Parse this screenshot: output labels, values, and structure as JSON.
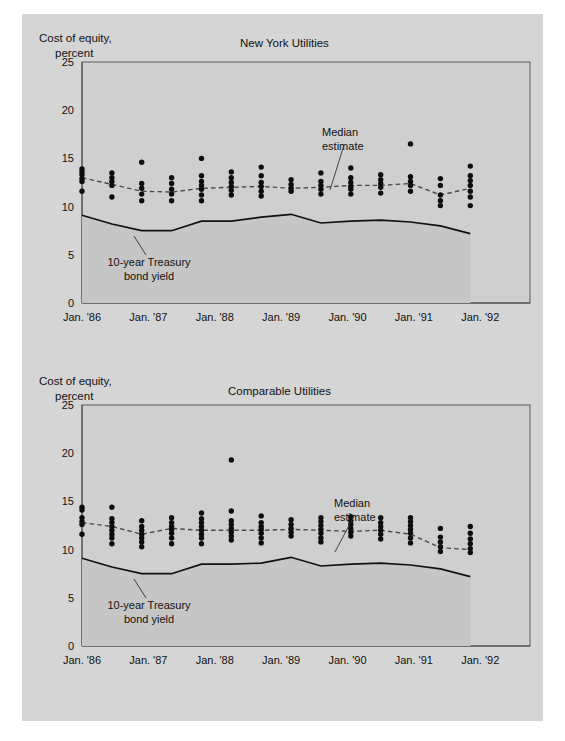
{
  "figure": {
    "background_color": "#d5d5d5",
    "plot_background_color": "#cfcfcf",
    "dot_color": "#0d0d0d"
  },
  "charts": [
    {
      "id": "new-york-utilities",
      "title": "New York Utilities",
      "y_axis_title_line1": "Cost of equity,",
      "y_axis_title_line2": "percent",
      "annotation_median": "Median\nestimate",
      "annotation_median_line1": "Median",
      "annotation_median_line2": "estimate",
      "annotation_treasury_line1": "10-year Treasury",
      "annotation_treasury_line2": "bond yield",
      "y_ticks": [
        "0",
        "5",
        "10",
        "15",
        "20",
        "25"
      ],
      "x_ticks": [
        "Jan. '86",
        "Jan. '87",
        "Jan. '88",
        "Jan. '89",
        "Jan. '90",
        "Jan. '91",
        "Jan. '92"
      ]
    },
    {
      "id": "comparable-utilities",
      "title": "Comparable Utilities",
      "y_axis_title_line1": "Cost of equity,",
      "y_axis_title_line2": "percent",
      "annotation_median_line1": "Median",
      "annotation_median_line2": "estimate",
      "annotation_treasury_line1": "10-year Treasury",
      "annotation_treasury_line2": "bond yield",
      "y_ticks": [
        "0",
        "5",
        "10",
        "15",
        "20",
        "25"
      ],
      "x_ticks": [
        "Jan. '86",
        "Jan. '87",
        "Jan. '88",
        "Jan. '89",
        "Jan. '90",
        "Jan. '91",
        "Jan. '92"
      ]
    }
  ],
  "chart_data": [
    {
      "type": "scatter",
      "id": "new-york-utilities",
      "title": "New York Utilities",
      "xlabel": "",
      "ylabel": "Cost of equity, percent",
      "ylim": [
        0,
        25
      ],
      "yticks": [
        0,
        5,
        10,
        15,
        20,
        25
      ],
      "xlim": [
        1986.0,
        1992.75
      ],
      "xticks": [
        1986,
        1987,
        1988,
        1989,
        1990,
        1991,
        1992
      ],
      "xticklabels": [
        "Jan. '86",
        "Jan. '87",
        "Jan. '88",
        "Jan. '89",
        "Jan. '90",
        "Jan. '91",
        "Jan. '92"
      ],
      "grid": false,
      "legend": "none",
      "annotations": [
        {
          "text": "Median estimate",
          "x": 1989.9,
          "y": 18.0
        },
        {
          "text": "10-year Treasury bond yield",
          "x": 1986.6,
          "y": 5.6
        }
      ],
      "scatter_columns": [
        {
          "x": 1986.0,
          "values": [
            13.9,
            13.6,
            13.3,
            12.9,
            12.6,
            11.6
          ]
        },
        {
          "x": 1986.45,
          "values": [
            13.5,
            13.0,
            12.6,
            12.2,
            11.0
          ]
        },
        {
          "x": 1986.9,
          "values": [
            14.6,
            12.4,
            11.9,
            11.3,
            10.6
          ]
        },
        {
          "x": 1987.35,
          "values": [
            13.0,
            12.4,
            11.8,
            11.3,
            10.6
          ]
        },
        {
          "x": 1987.8,
          "values": [
            15.0,
            13.2,
            12.6,
            12.2,
            11.8,
            11.2,
            10.6
          ]
        },
        {
          "x": 1988.25,
          "values": [
            13.6,
            13.0,
            12.5,
            12.1,
            11.7,
            11.2
          ]
        },
        {
          "x": 1988.7,
          "values": [
            14.1,
            13.2,
            12.5,
            12.1,
            11.6,
            11.1
          ]
        },
        {
          "x": 1989.15,
          "values": [
            12.8,
            12.3,
            11.9,
            11.6
          ]
        },
        {
          "x": 1989.6,
          "values": [
            13.5,
            12.6,
            12.2,
            11.8,
            11.3
          ]
        },
        {
          "x": 1990.05,
          "values": [
            14.0,
            13.0,
            12.5,
            12.1,
            11.8,
            11.3
          ]
        },
        {
          "x": 1990.5,
          "values": [
            13.3,
            12.8,
            12.4,
            12.0,
            11.4
          ]
        },
        {
          "x": 1990.95,
          "values": [
            16.5,
            13.1,
            12.6,
            12.2,
            11.6
          ]
        },
        {
          "x": 1991.4,
          "values": [
            12.9,
            12.2,
            11.2,
            10.6,
            10.1
          ]
        },
        {
          "x": 1991.85,
          "values": [
            14.2,
            13.2,
            12.7,
            12.2,
            11.6,
            11.0,
            10.1
          ]
        }
      ],
      "median_series": {
        "name": "Median estimate",
        "style": "dashed",
        "x": [
          1986.0,
          1986.45,
          1986.9,
          1987.35,
          1987.8,
          1988.25,
          1988.7,
          1989.15,
          1989.6,
          1990.05,
          1990.5,
          1990.95,
          1991.4,
          1991.85
        ],
        "y": [
          13.0,
          12.3,
          11.6,
          11.5,
          11.9,
          12.0,
          12.1,
          11.9,
          12.0,
          12.2,
          12.2,
          12.4,
          11.2,
          11.9
        ]
      },
      "treasury_series": {
        "name": "10-year Treasury bond yield",
        "style": "solid",
        "x": [
          1986.0,
          1986.45,
          1986.9,
          1987.35,
          1987.8,
          1988.25,
          1988.7,
          1989.15,
          1989.6,
          1990.05,
          1990.5,
          1990.95,
          1991.4,
          1991.85
        ],
        "y": [
          9.1,
          8.2,
          7.5,
          7.5,
          8.5,
          8.5,
          8.9,
          9.2,
          8.3,
          8.5,
          8.6,
          8.4,
          8.0,
          7.2
        ]
      }
    },
    {
      "type": "scatter",
      "id": "comparable-utilities",
      "title": "Comparable Utilities",
      "xlabel": "",
      "ylabel": "Cost of equity, percent",
      "ylim": [
        0,
        25
      ],
      "yticks": [
        0,
        5,
        10,
        15,
        20,
        25
      ],
      "xlim": [
        1986.0,
        1992.75
      ],
      "xticks": [
        1986,
        1987,
        1988,
        1989,
        1990,
        1991,
        1992
      ],
      "xticklabels": [
        "Jan. '86",
        "Jan. '87",
        "Jan. '88",
        "Jan. '89",
        "Jan. '90",
        "Jan. '91",
        "Jan. '92"
      ],
      "grid": false,
      "legend": "none",
      "annotations": [
        {
          "text": "Median estimate",
          "x": 1990.1,
          "y": 17.3
        },
        {
          "text": "10-year Treasury bond yield",
          "x": 1986.6,
          "y": 5.6
        }
      ],
      "scatter_columns": [
        {
          "x": 1986.0,
          "values": [
            14.4,
            14.1,
            13.3,
            12.9,
            12.6,
            11.6
          ]
        },
        {
          "x": 1986.45,
          "values": [
            14.4,
            13.2,
            12.8,
            12.4,
            12.0,
            11.6,
            11.2,
            10.6
          ]
        },
        {
          "x": 1986.9,
          "values": [
            13.0,
            12.4,
            12.0,
            11.6,
            11.2,
            10.8,
            10.3
          ]
        },
        {
          "x": 1987.35,
          "values": [
            13.3,
            12.8,
            12.4,
            12.1,
            11.7,
            11.2,
            10.6
          ]
        },
        {
          "x": 1987.8,
          "values": [
            13.8,
            13.2,
            12.8,
            12.4,
            12.0,
            11.6,
            11.2,
            10.6
          ]
        },
        {
          "x": 1988.25,
          "values": [
            19.3,
            14.0,
            13.0,
            12.6,
            12.2,
            11.8,
            11.4,
            11.0
          ]
        },
        {
          "x": 1988.7,
          "values": [
            13.5,
            12.8,
            12.4,
            12.1,
            11.7,
            11.2,
            10.7
          ]
        },
        {
          "x": 1989.15,
          "values": [
            13.1,
            12.6,
            12.2,
            11.8,
            11.4
          ]
        },
        {
          "x": 1989.6,
          "values": [
            13.3,
            12.9,
            12.5,
            12.1,
            11.7,
            11.2,
            10.8
          ]
        },
        {
          "x": 1990.05,
          "values": [
            13.4,
            13.0,
            12.6,
            12.2,
            11.8,
            11.4
          ]
        },
        {
          "x": 1990.5,
          "values": [
            13.3,
            12.8,
            12.4,
            12.0,
            11.6,
            11.1
          ]
        },
        {
          "x": 1990.95,
          "values": [
            13.3,
            12.9,
            12.5,
            12.1,
            11.7,
            11.2,
            10.7
          ]
        },
        {
          "x": 1991.4,
          "values": [
            12.2,
            11.3,
            10.8,
            10.3,
            9.8
          ]
        },
        {
          "x": 1991.85,
          "values": [
            12.4,
            11.7,
            11.1,
            10.6,
            10.1,
            9.7
          ]
        }
      ],
      "median_series": {
        "name": "Median estimate",
        "style": "dashed",
        "x": [
          1986.0,
          1986.45,
          1986.9,
          1987.35,
          1987.8,
          1988.25,
          1988.7,
          1989.15,
          1989.6,
          1990.05,
          1990.5,
          1990.95,
          1991.4,
          1991.85
        ],
        "y": [
          12.8,
          12.4,
          11.6,
          12.2,
          12.0,
          12.0,
          12.0,
          12.1,
          12.0,
          11.9,
          12.0,
          11.6,
          10.2,
          10.0
        ]
      },
      "treasury_series": {
        "name": "10-year Treasury bond yield",
        "style": "solid",
        "x": [
          1986.0,
          1986.45,
          1986.9,
          1987.35,
          1987.8,
          1988.25,
          1988.7,
          1989.15,
          1989.6,
          1990.05,
          1990.5,
          1990.95,
          1991.4,
          1991.85
        ],
        "y": [
          9.1,
          8.2,
          7.5,
          7.5,
          8.5,
          8.5,
          8.6,
          9.2,
          8.3,
          8.5,
          8.6,
          8.4,
          8.0,
          7.2
        ]
      }
    }
  ]
}
